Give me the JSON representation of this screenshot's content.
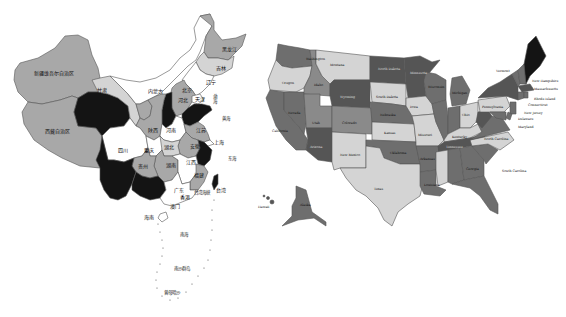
{
  "colors": {
    "background": "#ffffff",
    "white": "#ffffff",
    "light": "#d4d4d4",
    "mid": "#a8a8a8",
    "midDark": "#8a8a8a",
    "dark": "#6e6e6e",
    "darker": "#555555",
    "black": "#141414",
    "outline": "#555555"
  },
  "china_map": {
    "regions": [
      {
        "id": "xinjiang",
        "label": "新疆维吾尔自治区",
        "shade": "mid"
      },
      {
        "id": "xizang",
        "label": "西藏自治区",
        "shade": "mid"
      },
      {
        "id": "qinghai",
        "label": "",
        "shade": "black"
      },
      {
        "id": "gansu",
        "label": "甘肃",
        "shade": "light"
      },
      {
        "id": "neimenggu",
        "label": "内蒙古",
        "shade": "white"
      },
      {
        "id": "heilongjiang",
        "label": "黑龙江",
        "shade": "mid"
      },
      {
        "id": "jilin",
        "label": "吉林",
        "shade": "light"
      },
      {
        "id": "liaoning",
        "label": "辽宁",
        "shade": "white"
      },
      {
        "id": "beijing",
        "label": "北京",
        "shade": "mid"
      },
      {
        "id": "tianjin",
        "label": "天津",
        "shade": "white"
      },
      {
        "id": "hebei",
        "label": "河北",
        "shade": "mid"
      },
      {
        "id": "shanxi",
        "label": "",
        "shade": "black"
      },
      {
        "id": "shandong",
        "label": "",
        "shade": "black"
      },
      {
        "id": "ningxia",
        "label": "宁夏",
        "shade": "mid"
      },
      {
        "id": "shaanxi",
        "label": "陕西",
        "shade": "mid"
      },
      {
        "id": "henan",
        "label": "河南",
        "shade": "white"
      },
      {
        "id": "jiangsu",
        "label": "江苏",
        "shade": "mid"
      },
      {
        "id": "anhui",
        "label": "安徽",
        "shade": "mid"
      },
      {
        "id": "shanghai",
        "label": "上海",
        "shade": "white"
      },
      {
        "id": "zhejiang",
        "label": "",
        "shade": "black"
      },
      {
        "id": "sichuan",
        "label": "四川",
        "shade": "white"
      },
      {
        "id": "chongqing",
        "label": "重庆",
        "shade": "white"
      },
      {
        "id": "hubei",
        "label": "湖北",
        "shade": "light"
      },
      {
        "id": "hunan",
        "label": "湖南",
        "shade": "mid"
      },
      {
        "id": "jiangxi",
        "label": "江西",
        "shade": "white"
      },
      {
        "id": "fujian",
        "label": "福建",
        "shade": "mid"
      },
      {
        "id": "guizhou",
        "label": "贵州",
        "shade": "mid"
      },
      {
        "id": "yunnan",
        "label": "",
        "shade": "black"
      },
      {
        "id": "guangxi",
        "label": "",
        "shade": "black"
      },
      {
        "id": "guangdong",
        "label": "广东",
        "shade": "white"
      },
      {
        "id": "hongkong",
        "label": "香港",
        "shade": "white"
      },
      {
        "id": "macau",
        "label": "澳门",
        "shade": "white"
      },
      {
        "id": "hainan",
        "label": "海南",
        "shade": "white"
      },
      {
        "id": "taiwan",
        "label": "台湾",
        "shade": "black"
      }
    ],
    "sea_labels": {
      "bohai": "渤海",
      "huanghai": "黄海",
      "donghai": "东海",
      "taiwan_strait": "台湾海峡",
      "nanhai": "南海",
      "nansha": "南沙群岛",
      "zengmu": "曾母暗沙"
    }
  },
  "us_map": {
    "states": [
      {
        "id": "WA",
        "label": "Washington",
        "capital": "Olympia",
        "shade": "dark"
      },
      {
        "id": "OR",
        "label": "Oregon",
        "capital": "Salem",
        "shade": "light"
      },
      {
        "id": "CA",
        "label": "California",
        "capital": "Sacramento",
        "shade": "dark"
      },
      {
        "id": "NV",
        "label": "Nevada",
        "capital": "Carson City",
        "shade": "dark"
      },
      {
        "id": "ID",
        "label": "Idaho",
        "capital": "Boise",
        "shade": "midDark"
      },
      {
        "id": "MT",
        "label": "Montana",
        "capital": "Helena",
        "shade": "light"
      },
      {
        "id": "WY",
        "label": "Wyoming",
        "capital": "Cheyenne",
        "shade": "darker"
      },
      {
        "id": "UT",
        "label": "Utah",
        "capital": "Salt Lake City",
        "shade": "midDark"
      },
      {
        "id": "AZ",
        "label": "Arizona",
        "capital": "Phoenix",
        "shade": "darker"
      },
      {
        "id": "CO",
        "label": "Colorado",
        "capital": "Denver",
        "shade": "midDark"
      },
      {
        "id": "NM",
        "label": "New Mexico",
        "capital": "Santa Fe",
        "shade": "light"
      },
      {
        "id": "ND",
        "label": "North Dakota",
        "capital": "Bismarck",
        "shade": "darker"
      },
      {
        "id": "SD",
        "label": "South Dakota",
        "capital": "Pierre",
        "shade": "light"
      },
      {
        "id": "NE",
        "label": "Nebraska",
        "capital": "Lincoln",
        "shade": "dark"
      },
      {
        "id": "KS",
        "label": "Kansas",
        "capital": "Topeka",
        "shade": "light"
      },
      {
        "id": "OK",
        "label": "Oklahoma",
        "capital": "Oklahoma City",
        "shade": "dark"
      },
      {
        "id": "TX",
        "label": "Texas",
        "capital": "Austin",
        "shade": "light"
      },
      {
        "id": "MN",
        "label": "Minnesota",
        "capital": "St. Paul",
        "shade": "darker"
      },
      {
        "id": "IA",
        "label": "Iowa",
        "capital": "Des Moines",
        "shade": "light"
      },
      {
        "id": "MO",
        "label": "Missouri",
        "capital": "Jefferson City",
        "shade": "light"
      },
      {
        "id": "AR",
        "label": "Arkansas",
        "capital": "Little Rock",
        "shade": "dark"
      },
      {
        "id": "LA",
        "label": "Louisiana",
        "capital": "Baton Rouge",
        "shade": "dark"
      },
      {
        "id": "WI",
        "label": "Wisconsin",
        "capital": "Madison",
        "shade": "dark"
      },
      {
        "id": "IL",
        "label": "Illinois",
        "capital": "Springfield",
        "shade": "dark"
      },
      {
        "id": "MI",
        "label": "Michigan",
        "capital": "Lansing",
        "shade": "dark"
      },
      {
        "id": "IN",
        "label": "Indiana",
        "capital": "Indianapolis",
        "shade": "dark"
      },
      {
        "id": "OH",
        "label": "Ohio",
        "capital": "Columbus",
        "shade": "light"
      },
      {
        "id": "KY",
        "label": "Kentucky",
        "capital": "Frankfort",
        "shade": "light"
      },
      {
        "id": "TN",
        "label": "Tennessee",
        "capital": "Nashville",
        "shade": "darker"
      },
      {
        "id": "MS",
        "label": "Mississippi",
        "capital": "Jackson",
        "shade": "light"
      },
      {
        "id": "AL",
        "label": "Alabama",
        "capital": "Montgomery",
        "shade": "dark"
      },
      {
        "id": "GA",
        "label": "Georgia",
        "capital": "Atlanta",
        "shade": "dark"
      },
      {
        "id": "FL",
        "label": "Florida",
        "capital": "Tallahassee",
        "shade": "dark"
      },
      {
        "id": "SC",
        "label": "South Carolina",
        "capital": "Columbia",
        "shade": "dark"
      },
      {
        "id": "NC",
        "label": "North Carolina",
        "capital": "Raleigh",
        "shade": "light"
      },
      {
        "id": "VA",
        "label": "Virginia",
        "capital": "Richmond",
        "shade": "dark"
      },
      {
        "id": "WV",
        "label": "West Virginia",
        "capital": "Charleston",
        "shade": "darker"
      },
      {
        "id": "PA",
        "label": "Pennsylvania",
        "capital": "Harrisburg",
        "shade": "light"
      },
      {
        "id": "NY",
        "label": "New York",
        "capital": "Albany",
        "shade": "darker"
      },
      {
        "id": "VT",
        "label": "Vermont",
        "capital": "Montpelier",
        "shade": "dark"
      },
      {
        "id": "NH",
        "label": "New Hampshire",
        "capital": "Concord",
        "shade": "dark"
      },
      {
        "id": "ME",
        "label": "Maine",
        "capital": "Augusta",
        "shade": "black"
      },
      {
        "id": "MA",
        "label": "Massachusetts",
        "capital": "Boston",
        "shade": "darker"
      },
      {
        "id": "RI",
        "label": "Rhode Island",
        "capital": "Providence",
        "shade": "dark"
      },
      {
        "id": "CT",
        "label": "Connecticut",
        "capital": "Hartford",
        "shade": "dark"
      },
      {
        "id": "NJ",
        "label": "New Jersey",
        "capital": "Trenton",
        "shade": "dark"
      },
      {
        "id": "DE",
        "label": "Delaware",
        "capital": "Dover",
        "shade": "dark"
      },
      {
        "id": "MD",
        "label": "Maryland",
        "capital": "Annapolis",
        "shade": "dark"
      },
      {
        "id": "AK",
        "label": "Alaska",
        "capital": "Juneau",
        "shade": "dark"
      },
      {
        "id": "HI",
        "label": "Hawaii",
        "capital": "Honolulu",
        "shade": "darker"
      }
    ]
  }
}
